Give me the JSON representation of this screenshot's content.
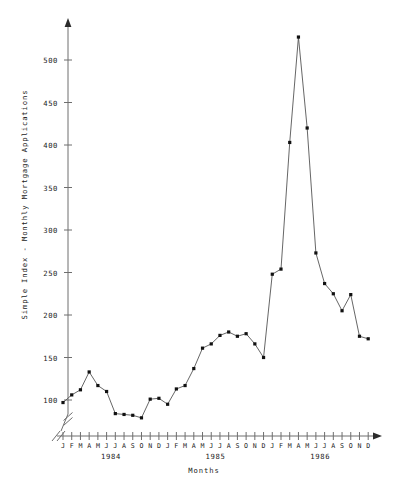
{
  "chart_data": {
    "type": "line",
    "title": "",
    "xlabel": "Months",
    "ylabel": "Simple Index - Monthly Mortgage Applications",
    "ylim": [
      75,
      545
    ],
    "yticks": [
      100,
      150,
      200,
      250,
      300,
      350,
      400,
      450,
      500
    ],
    "ytick_labels": [
      "100",
      "150",
      "200",
      "250",
      "300",
      "350",
      "400",
      "450",
      "500"
    ],
    "axis_break": true,
    "grid": false,
    "legend": "none",
    "month_letters": [
      "J",
      "F",
      "M",
      "A",
      "M",
      "J",
      "J",
      "A",
      "S",
      "O",
      "N",
      "D"
    ],
    "years": [
      "1984",
      "1985",
      "1986"
    ],
    "x": [
      "1984-01",
      "1984-02",
      "1984-03",
      "1984-04",
      "1984-05",
      "1984-06",
      "1984-07",
      "1984-08",
      "1984-09",
      "1984-10",
      "1984-11",
      "1984-12",
      "1985-01",
      "1985-02",
      "1985-03",
      "1985-04",
      "1985-05",
      "1985-06",
      "1985-07",
      "1985-08",
      "1985-09",
      "1985-10",
      "1985-11",
      "1985-12",
      "1986-01",
      "1986-02",
      "1986-03",
      "1986-04",
      "1986-05",
      "1986-06",
      "1986-07",
      "1986-08",
      "1986-09",
      "1986-10",
      "1986-11",
      "1986-12"
    ],
    "values": [
      97,
      106,
      112,
      133,
      117,
      110,
      84,
      83,
      82,
      79,
      101,
      102,
      95,
      113,
      117,
      137,
      161,
      166,
      176,
      180,
      175,
      178,
      166,
      150,
      248,
      254,
      403,
      527,
      420,
      273,
      237,
      225,
      205,
      224,
      175,
      172
    ],
    "marker": "filled-square",
    "line_color": "#555555",
    "marker_color": "#111111",
    "axis_color": "#6e6e6e",
    "background": "#ffffff"
  }
}
